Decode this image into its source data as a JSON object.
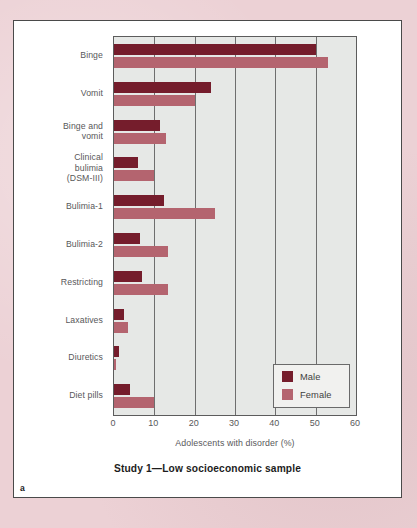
{
  "figure": {
    "panel_letter": "a",
    "caption": "Study 1—Low socioeconomic sample"
  },
  "legend": {
    "position": "bottom-right-inside",
    "entries": [
      {
        "label": "Male",
        "color": "#751d2c"
      },
      {
        "label": "Female",
        "color": "#b4646f"
      }
    ]
  },
  "chart_data": {
    "type": "bar",
    "orientation": "horizontal",
    "title": "Study 1—Low socioeconomic sample",
    "xlabel": "Adolescents with disorder (%)",
    "ylabel": "",
    "xlim": [
      0,
      60
    ],
    "xticks": [
      0,
      10,
      20,
      30,
      40,
      50,
      60
    ],
    "xtick_labels": [
      "0",
      "10",
      "20",
      "30",
      "40",
      "50",
      "60"
    ],
    "grid": "vertical",
    "plot_bgcolor": "#e6e8e6",
    "categories": [
      "Binge",
      "Vomit",
      "Binge and\nvomit",
      "Clinical\nbulimia\n(DSM-III)",
      "Bulimia-1",
      "Bulimia-2",
      "Restricting",
      "Laxatives",
      "Diuretics",
      "Diet pills"
    ],
    "series": [
      {
        "name": "Male",
        "color": "#751d2c",
        "values": [
          50.0,
          24.0,
          11.5,
          6.0,
          12.5,
          6.5,
          7.0,
          2.5,
          1.3,
          4.0
        ]
      },
      {
        "name": "Female",
        "color": "#b4646f",
        "values": [
          53.0,
          20.0,
          13.0,
          10.0,
          25.0,
          13.5,
          13.5,
          3.5,
          0.6,
          9.8
        ]
      }
    ]
  }
}
